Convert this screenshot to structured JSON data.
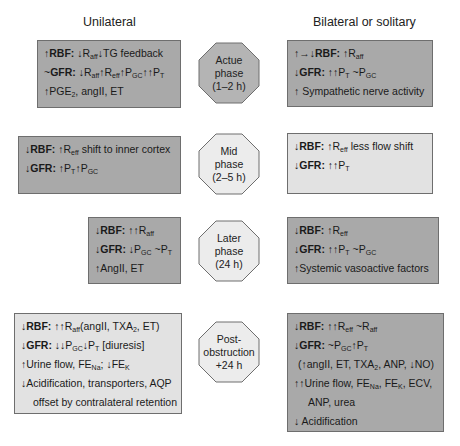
{
  "columns": {
    "left_title": "Unilateral",
    "right_title": "Bilateral or solitary"
  },
  "phases": [
    {
      "label": "Actue\nphase\n(1–2 h)",
      "fill": "#b4b4b4"
    },
    {
      "label": "Mid\nphase\n(2–5 h)",
      "fill": "#ececec"
    },
    {
      "label": "Later\nphase\n(24 h)",
      "fill": "#ececec"
    },
    {
      "label": "Post-\nobstruction\n+24 h",
      "fill": "#ececec"
    }
  ],
  "unilateral": {
    "acute": {
      "rbf_arrow": "↑",
      "rbf_label": "RBF:",
      "rbf_text": "↓R",
      "rbf_sub": "aff",
      "rbf_text2": "↓TG feedback",
      "gfr_arrow": "~",
      "gfr_label": "GFR:",
      "line3": "↑PGE",
      "line3_sub": "2",
      "line3_rest": ", angII, ET"
    },
    "mid": {
      "rbf_arrow": "↓",
      "rbf_label": "RBF:",
      "rbf_text": "↑R",
      "rbf_sub": "eff",
      "rbf_text2": " shift to inner cortex",
      "gfr_arrow": "↓",
      "gfr_label": "GFR:"
    },
    "later": {
      "rbf_arrow": "↓",
      "rbf_label": "RBF:",
      "rbf_text": "↑↑R",
      "rbf_sub": "aff",
      "gfr_arrow": "↓",
      "gfr_label": "GFR:",
      "line3": "↑AngII, ET"
    },
    "post": {
      "rbf_arrow": "↓",
      "rbf_label": "RBF:",
      "rbf_text": "↑↑R",
      "rbf_sub": "aff",
      "rbf_text2": "(angII, TXA",
      "rbf_sub2": "2",
      "rbf_text3": ", ET)",
      "gfr_arrow": "↓",
      "gfr_label": "GFR:",
      "gfr_text3": " [diuresis]",
      "line3a": "↑Urine flow, FE",
      "line3_sub": "Na",
      "line3b": "; ↓FE",
      "line3_sub2": "K",
      "line4": "↓Acidification, transporters, AQP",
      "line5": "offset by contralateral retention"
    }
  },
  "bilateral": {
    "acute": {
      "rbf_arrow": "↑→↓",
      "rbf_label": "RBF:",
      "rbf_text": "↑R",
      "rbf_sub": "aff",
      "gfr_arrow": "↓",
      "gfr_label": "GFR:",
      "gfr_text": "↑↑P",
      "gfr_sub": "T",
      "gfr_text2": " ~P",
      "gfr_sub2": "GC",
      "line3": "↑ Sympathetic nerve activity"
    },
    "mid": {
      "rbf_arrow": "↓",
      "rbf_label": "RBF:",
      "rbf_text": "↑R",
      "rbf_sub": "eff",
      "rbf_text2": " less flow shift",
      "gfr_arrow": "↓",
      "gfr_label": "GFR:",
      "gfr_text": "↑↑P",
      "gfr_sub": "T"
    },
    "later": {
      "rbf_arrow": "↓",
      "rbf_label": "RBF:",
      "rbf_text": "↑R",
      "rbf_sub": "eff",
      "gfr_arrow": "↓",
      "gfr_label": "GFR:",
      "gfr_text": "↑↑P",
      "gfr_sub": "T",
      "gfr_text2": " ~P",
      "gfr_sub2": "GC",
      "line3": "↑Systemic vasoactive factors"
    },
    "post": {
      "rbf_arrow": "↓",
      "rbf_label": "RBF:",
      "rbf_text": "↑↑R",
      "rbf_sub": "eff",
      "rbf_text2": " ~R",
      "rbf_sub2": "aff",
      "gfr_arrow": "↓",
      "gfr_label": "GFR:",
      "gfr_text": "~P",
      "gfr_sub": "GC",
      "gfr_text2": "↑P",
      "gfr_sub2": "T",
      "line3a": "(↑angII, ET, TXA",
      "line3_sub": "2",
      "line3b": ", ANP, ↓NO)",
      "line4a": "↑↑Urine flow, FE",
      "line4_sub": "Na",
      "line4b": ", FE",
      "line4_sub2": "K",
      "line4c": ", ECV,",
      "line5": "ANP, urea",
      "line6": "↓ Acidification"
    }
  },
  "colors": {
    "dark_box": "#a9a9a9",
    "light_box": "#e2e2e2",
    "border": "#6e6e6e"
  }
}
